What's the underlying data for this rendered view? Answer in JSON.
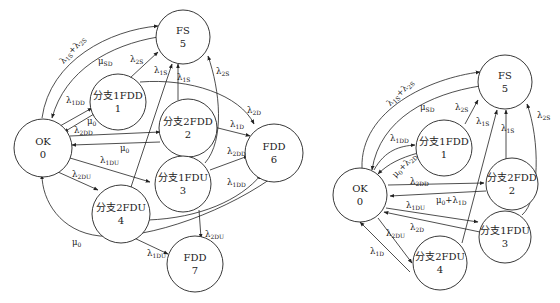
{
  "diagram_left": {
    "nodes": [
      {
        "id": "0",
        "name": "OK",
        "num": "0"
      },
      {
        "id": "1",
        "name": "分支1FDD",
        "num": "1"
      },
      {
        "id": "2",
        "name": "分支2FDD",
        "num": "2"
      },
      {
        "id": "3",
        "name": "分支1FDU",
        "num": "3"
      },
      {
        "id": "4",
        "name": "分支2FDU",
        "num": "4"
      },
      {
        "id": "5",
        "name": "FS",
        "num": "5"
      },
      {
        "id": "6",
        "name": "FDD",
        "num": "6"
      },
      {
        "id": "7",
        "name": "FDD",
        "num": "7"
      }
    ],
    "edges": [
      {
        "from": "0",
        "to": "5",
        "label": "λ1S+λ2S"
      },
      {
        "from": "5",
        "to": "0",
        "label": "μSD"
      },
      {
        "from": "0",
        "to": "1",
        "label": "λ1DD"
      },
      {
        "from": "1",
        "to": "0",
        "label": "μ0"
      },
      {
        "from": "0",
        "to": "2",
        "label": "λ2DD"
      },
      {
        "from": "2",
        "to": "0",
        "label": "μ0"
      },
      {
        "from": "0",
        "to": "3",
        "label": "λ1DU"
      },
      {
        "from": "0",
        "to": "4",
        "label": "λ2DU"
      },
      {
        "from": "1",
        "to": "5",
        "label": "λ2S"
      },
      {
        "from": "4",
        "to": "5",
        "label": "λ1S"
      },
      {
        "from": "2",
        "to": "5",
        "label": "λ1S"
      },
      {
        "from": "3",
        "to": "5",
        "label": "λ2S"
      },
      {
        "from": "1",
        "to": "6",
        "label": "λ2D"
      },
      {
        "from": "2",
        "to": "6",
        "label": "λ1D"
      },
      {
        "from": "3",
        "to": "6",
        "label": "λ2DD"
      },
      {
        "from": "4",
        "to": "6",
        "label": "λ1DD"
      },
      {
        "from": "3",
        "to": "7",
        "label": "λ2DU"
      },
      {
        "from": "4",
        "to": "7",
        "label": "λ1DU"
      },
      {
        "from": "6",
        "to": "0",
        "label": "μ0"
      }
    ]
  },
  "diagram_right": {
    "nodes": [
      {
        "id": "0",
        "name": "OK",
        "num": "0"
      },
      {
        "id": "1",
        "name": "分支1FDD",
        "num": "1"
      },
      {
        "id": "2",
        "name": "分支2FDD",
        "num": "2"
      },
      {
        "id": "3",
        "name": "分支1FDU",
        "num": "3"
      },
      {
        "id": "4",
        "name": "分支2FDU",
        "num": "4"
      },
      {
        "id": "5",
        "name": "FS",
        "num": "5"
      }
    ],
    "edges": [
      {
        "from": "0",
        "to": "5",
        "label": "λ1S+λ2S"
      },
      {
        "from": "5",
        "to": "0",
        "label": "μSD"
      },
      {
        "from": "0",
        "to": "1",
        "label": "λ1DD"
      },
      {
        "from": "1",
        "to": "0",
        "label": "μ0+λ2D"
      },
      {
        "from": "0",
        "to": "2",
        "label": "λ2DD"
      },
      {
        "from": "2",
        "to": "0",
        "label": "μ0+λ1D"
      },
      {
        "from": "0",
        "to": "3",
        "label": "λ1DU"
      },
      {
        "from": "3",
        "to": "0",
        "label": "λ2D"
      },
      {
        "from": "0",
        "to": "4",
        "label": "λ2DU"
      },
      {
        "from": "4",
        "to": "0",
        "label": "λ1D"
      },
      {
        "from": "1",
        "to": "5",
        "label": "λ2S"
      },
      {
        "from": "4",
        "to": "5",
        "label": "λ1S"
      },
      {
        "from": "2",
        "to": "5",
        "label": "λ1S"
      },
      {
        "from": "3",
        "to": "5",
        "label": "λ2S"
      }
    ]
  },
  "labels": {
    "L": {
      "l1s2s": [
        "λ",
        "1S",
        "+λ",
        "2S"
      ],
      "musd": [
        "μ",
        "SD"
      ],
      "l1dd_a": [
        "λ",
        "1DD"
      ],
      "mu0_a": [
        "μ",
        "0"
      ],
      "l2dd_a": [
        "λ",
        "2DD"
      ],
      "mu0_b": [
        "μ",
        "0"
      ],
      "l1du_a": [
        "λ",
        "1DU"
      ],
      "l2du_a": [
        "λ",
        "2DU"
      ],
      "l2s_a": [
        "λ",
        "2S"
      ],
      "l1s_a": [
        "λ",
        "1S"
      ],
      "l1s_b": [
        "λ",
        "1S"
      ],
      "l2s_b": [
        "λ",
        "2S"
      ],
      "l2d": [
        "λ",
        "2D"
      ],
      "l1d": [
        "λ",
        "1D"
      ],
      "l2dd_b": [
        "λ",
        "2DD"
      ],
      "l1dd_b": [
        "λ",
        "1DD"
      ],
      "l2du_b": [
        "λ",
        "2DU"
      ],
      "l1du_b": [
        "λ",
        "1DU"
      ],
      "mu0_c": [
        "μ",
        "0"
      ]
    },
    "R": {
      "l1s2s": [
        "λ",
        "1S",
        "+λ",
        "2S"
      ],
      "musd": [
        "μ",
        "SD"
      ],
      "l1dd": [
        "λ",
        "1DD"
      ],
      "mu0l2d": [
        "μ",
        "0",
        "+λ",
        "2D"
      ],
      "l2dd": [
        "λ",
        "2DD"
      ],
      "mu0l1d": [
        "μ",
        "0",
        "+λ",
        "1D"
      ],
      "l1du": [
        "λ",
        "1DU"
      ],
      "l2d": [
        "λ",
        "2D"
      ],
      "l2du": [
        "λ",
        "2DU"
      ],
      "l1d": [
        "λ",
        "1D"
      ],
      "l2s_a": [
        "λ",
        "2S"
      ],
      "l1s_a": [
        "λ",
        "1S"
      ],
      "l1s_b": [
        "λ",
        "1S"
      ],
      "l2s_b": [
        "λ",
        "2S"
      ]
    }
  }
}
